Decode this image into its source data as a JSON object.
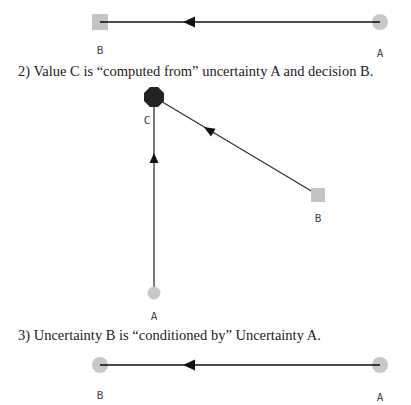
{
  "colors": {
    "edge": "#111111",
    "uncertainty_node": "#c8c8c8",
    "decision_node": "#c4c4c4",
    "value_node": "#222222",
    "label": "#444444",
    "caption": "#222222"
  },
  "diagrams": [
    {
      "caption": "",
      "nodes": [
        {
          "id": "B",
          "label": "B",
          "type": "decision",
          "shape": "square"
        },
        {
          "id": "A",
          "label": "A",
          "type": "uncertainty",
          "shape": "circle"
        }
      ],
      "edges": [
        {
          "from": "A",
          "to": "B"
        }
      ]
    },
    {
      "caption": "2) Value C is “computed from” uncertainty A and decision B.",
      "nodes": [
        {
          "id": "C",
          "label": "C",
          "type": "value",
          "shape": "octagon"
        },
        {
          "id": "B",
          "label": "B",
          "type": "decision",
          "shape": "square"
        },
        {
          "id": "A",
          "label": "A",
          "type": "uncertainty",
          "shape": "circle"
        }
      ],
      "edges": [
        {
          "from": "A",
          "to": "C"
        },
        {
          "from": "B",
          "to": "C"
        }
      ]
    },
    {
      "caption": "3) Uncertainty B is “conditioned by” Uncertainty A.",
      "nodes": [
        {
          "id": "B",
          "label": "B",
          "type": "uncertainty",
          "shape": "circle"
        },
        {
          "id": "A",
          "label": "A",
          "type": "uncertainty",
          "shape": "circle"
        }
      ],
      "edges": [
        {
          "from": "A",
          "to": "B"
        }
      ]
    }
  ]
}
